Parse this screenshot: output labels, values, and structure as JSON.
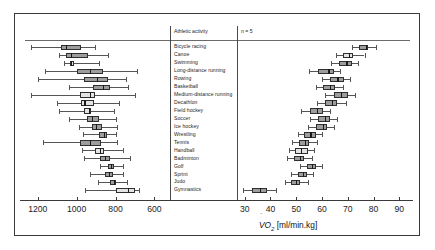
{
  "figure": {
    "header": {
      "activity_column_title": "Athletic activity",
      "sample_size_note": "n = 5"
    },
    "axis_title": {
      "symbol": "V",
      "subscript": "O",
      "sub_index": "2",
      "units": "[ml/min.kg]",
      "full": "VO2 [ml/min.kg]"
    }
  },
  "chart_data": {
    "type": "box",
    "title": "",
    "subtitle": "",
    "orientation": "horizontal",
    "panels": [
      {
        "name": "left",
        "xlabel": "",
        "ylabel": "",
        "reversed": true,
        "xlim": [
          1250,
          520
        ],
        "ticks": [
          1200,
          1000,
          800,
          600
        ],
        "tick_labels": [
          "1200",
          "1000",
          "800",
          "600"
        ],
        "grid": false
      },
      {
        "name": "right",
        "xlabel": "",
        "ylabel": "",
        "reversed": false,
        "xlim": [
          27,
          93
        ],
        "ticks": [
          30,
          40,
          50,
          60,
          70,
          80,
          90
        ],
        "tick_labels": [
          "30",
          "40",
          "50",
          "60",
          "70",
          "80",
          "90"
        ],
        "grid": false
      }
    ],
    "categories": [
      "Bicycle racing",
      "Canoe",
      "Swimming",
      "Long-distance running",
      "Rowing",
      "Basketball",
      "Medium-distance running",
      "Decathlon",
      "Field hockey",
      "Soccer",
      "Ice hockey",
      "Wrestling",
      "Tennis",
      "Handball",
      "Badminton",
      "Golf",
      "Sprint",
      "Judo",
      "Gymnastics"
    ],
    "series": [
      {
        "name": "Absolute oxygen uptake (left panel)",
        "units": "ml/min",
        "boxes": [
          {
            "category": "Bicycle racing",
            "min": 1235,
            "q1": 1080,
            "median": 1055,
            "q3": 975,
            "max": 905,
            "shade": "dark"
          },
          {
            "category": "Canoe",
            "min": 1090,
            "q1": 1055,
            "median": 1030,
            "q3": 940,
            "max": 840,
            "shade": "dark"
          },
          {
            "category": "Swimming",
            "min": 1065,
            "q1": 1035,
            "median": 1030,
            "q3": 1015,
            "max": 885,
            "shade": "light"
          },
          {
            "category": "Long-distance running",
            "min": 1165,
            "q1": 1000,
            "median": 930,
            "q3": 865,
            "max": 690,
            "shade": "dark"
          },
          {
            "category": "Rowing",
            "min": 1200,
            "q1": 960,
            "median": 895,
            "q3": 840,
            "max": 745,
            "shade": "dark"
          },
          {
            "category": "Basketball",
            "min": 1040,
            "q1": 915,
            "median": 865,
            "q3": 830,
            "max": 735,
            "shade": "dark"
          },
          {
            "category": "Medium-distance running",
            "min": 1235,
            "q1": 985,
            "median": 930,
            "q3": 905,
            "max": 700,
            "shade": "light"
          },
          {
            "category": "Decathlon",
            "min": 1100,
            "q1": 980,
            "median": 960,
            "q3": 910,
            "max": 780,
            "shade": "light"
          },
          {
            "category": "Field hockey",
            "min": 1090,
            "q1": 960,
            "median": 935,
            "q3": 925,
            "max": 810,
            "shade": "light"
          },
          {
            "category": "Soccer",
            "min": 1040,
            "q1": 945,
            "median": 920,
            "q3": 885,
            "max": 800,
            "shade": "dark"
          },
          {
            "category": "Ice hockey",
            "min": 990,
            "q1": 920,
            "median": 900,
            "q3": 870,
            "max": 790,
            "shade": "dark"
          },
          {
            "category": "Wrestling",
            "min": 965,
            "q1": 885,
            "median": 860,
            "q3": 845,
            "max": 800,
            "shade": "dark"
          },
          {
            "category": "Tennis",
            "min": 1175,
            "q1": 985,
            "median": 930,
            "q3": 875,
            "max": 790,
            "shade": "dark"
          },
          {
            "category": "Handball",
            "min": 970,
            "q1": 905,
            "median": 880,
            "q3": 860,
            "max": 760,
            "shade": "light"
          },
          {
            "category": "Badminton",
            "min": 960,
            "q1": 880,
            "median": 855,
            "q3": 830,
            "max": 725,
            "shade": "dark"
          },
          {
            "category": "Golf",
            "min": 880,
            "q1": 840,
            "median": 825,
            "q3": 810,
            "max": 760,
            "shade": "dark"
          },
          {
            "category": "Sprint",
            "min": 930,
            "q1": 855,
            "median": 835,
            "q3": 815,
            "max": 760,
            "shade": "dark"
          },
          {
            "category": "Judo",
            "min": 890,
            "q1": 830,
            "median": 810,
            "q3": 800,
            "max": 740,
            "shade": "dark"
          },
          {
            "category": "Gymnastics",
            "min": 955,
            "q1": 800,
            "median": 735,
            "q3": 700,
            "max": 680,
            "shade": "light"
          }
        ]
      },
      {
        "name": "Relative oxygen uptake (right panel)",
        "units": "ml/min.kg",
        "boxes": [
          {
            "category": "Bicycle racing",
            "min": 71.5,
            "q1": 74.5,
            "median": 77.0,
            "q3": 78.0,
            "max": 81.0,
            "shade": "dark"
          },
          {
            "category": "Canoe",
            "min": 65.5,
            "q1": 68.0,
            "median": 70.5,
            "q3": 72.0,
            "max": 76.5,
            "shade": "light"
          },
          {
            "category": "Swimming",
            "min": 63.5,
            "q1": 66.5,
            "median": 69.5,
            "q3": 71.5,
            "max": 74.0,
            "shade": "dark"
          },
          {
            "category": "Long-distance running",
            "min": 55.0,
            "q1": 58.5,
            "median": 62.5,
            "q3": 64.5,
            "max": 67.0,
            "shade": "dark"
          },
          {
            "category": "Rowing",
            "min": 60.0,
            "q1": 63.0,
            "median": 66.0,
            "q3": 68.5,
            "max": 71.0,
            "shade": "dark"
          },
          {
            "category": "Basketball",
            "min": 57.5,
            "q1": 60.5,
            "median": 63.0,
            "q3": 65.0,
            "max": 68.0,
            "shade": "dark"
          },
          {
            "category": "Medium-distance running",
            "min": 61.0,
            "q1": 64.5,
            "median": 67.5,
            "q3": 70.0,
            "max": 73.0,
            "shade": "dark"
          },
          {
            "category": "Decathlon",
            "min": 58.0,
            "q1": 61.0,
            "median": 64.0,
            "q3": 66.0,
            "max": 69.5,
            "shade": "dark"
          },
          {
            "category": "Field hockey",
            "min": 52.0,
            "q1": 55.5,
            "median": 58.0,
            "q3": 60.5,
            "max": 63.0,
            "shade": "dark"
          },
          {
            "category": "Soccer",
            "min": 55.5,
            "q1": 58.5,
            "median": 61.0,
            "q3": 63.0,
            "max": 66.0,
            "shade": "dark"
          },
          {
            "category": "Ice hockey",
            "min": 54.5,
            "q1": 57.5,
            "median": 60.5,
            "q3": 62.0,
            "max": 64.5,
            "shade": "dark"
          },
          {
            "category": "Wrestling",
            "min": 50.5,
            "q1": 53.0,
            "median": 55.5,
            "q3": 57.5,
            "max": 60.0,
            "shade": "dark"
          },
          {
            "category": "Tennis",
            "min": 48.5,
            "q1": 51.0,
            "median": 53.5,
            "q3": 55.0,
            "max": 58.0,
            "shade": "dark"
          },
          {
            "category": "Handball",
            "min": 47.0,
            "q1": 49.5,
            "median": 52.0,
            "q3": 54.5,
            "max": 57.0,
            "shade": "light"
          },
          {
            "category": "Badminton",
            "min": 46.5,
            "q1": 49.0,
            "median": 51.5,
            "q3": 53.0,
            "max": 56.0,
            "shade": "dark"
          },
          {
            "category": "Golf",
            "min": 51.5,
            "q1": 54.0,
            "median": 56.0,
            "q3": 57.5,
            "max": 60.0,
            "shade": "dark"
          },
          {
            "category": "Sprint",
            "min": 48.0,
            "q1": 50.5,
            "median": 52.5,
            "q3": 54.0,
            "max": 56.5,
            "shade": "dark"
          },
          {
            "category": "Judo",
            "min": 45.5,
            "q1": 48.0,
            "median": 50.0,
            "q3": 51.5,
            "max": 54.5,
            "shade": "dark"
          },
          {
            "category": "Gymnastics",
            "min": 29.5,
            "q1": 33.0,
            "median": 36.0,
            "q3": 38.5,
            "max": 42.0,
            "shade": "dark"
          }
        ]
      }
    ]
  }
}
